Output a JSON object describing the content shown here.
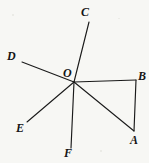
{
  "figure": {
    "background_color": "#f7f7f4",
    "stroke_color": "#1a1a1a",
    "stroke_width": 1.1,
    "canvas": {
      "width": 149,
      "height": 163
    },
    "points": {
      "O": {
        "x": 74,
        "y": 82,
        "label": "O",
        "label_x": 63,
        "label_y": 67
      },
      "A": {
        "x": 134,
        "y": 131,
        "label": "A",
        "label_x": 130,
        "label_y": 134
      },
      "B": {
        "x": 136,
        "y": 80,
        "label": "B",
        "label_x": 138,
        "label_y": 70
      },
      "C": {
        "x": 89,
        "y": 22,
        "label": "C",
        "label_x": 81,
        "label_y": 6
      },
      "D": {
        "x": 22,
        "y": 62,
        "label": "D",
        "label_x": 7,
        "label_y": 50
      },
      "E": {
        "x": 27,
        "y": 122,
        "label": "E",
        "label_x": 16,
        "label_y": 122
      },
      "F": {
        "x": 71,
        "y": 148,
        "label": "F",
        "label_x": 64,
        "label_y": 147
      }
    },
    "segments": [
      {
        "name": "segment-C-F",
        "from": "C",
        "to": "F",
        "via": "O"
      },
      {
        "name": "segment-D-A",
        "from": "D",
        "to": "A",
        "via": "O"
      },
      {
        "name": "segment-E-B",
        "from": "E",
        "to": "B",
        "via": "O"
      },
      {
        "name": "segment-B-A",
        "from": "B",
        "to": "A"
      }
    ],
    "labels": [
      "O",
      "A",
      "B",
      "C",
      "D",
      "E",
      "F"
    ]
  }
}
